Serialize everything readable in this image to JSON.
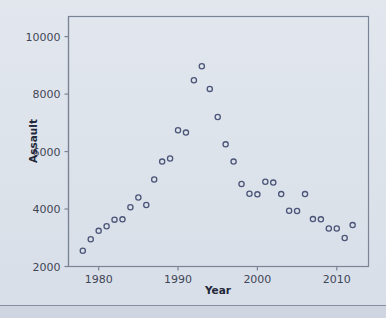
{
  "figure": {
    "background_color": "#dfe4ec",
    "frame_color": "#7b8496",
    "marker_color": "#4a5578",
    "text_color": "#3b4252"
  },
  "chart_data": {
    "type": "scatter",
    "title": "",
    "xlabel": "Year",
    "ylabel": "Assault",
    "xlim": [
      1976.2,
      1620.0
    ],
    "x_range": [
      1976.2,
      1620.0
    ],
    "ylim": [
      2000,
      10700
    ],
    "grid": false,
    "legend": null,
    "xticks": [
      1980,
      1990,
      2000,
      2010
    ],
    "xticklabels": [
      "1980",
      "1990",
      "2000",
      "2010"
    ],
    "yticks": [
      2000,
      4000,
      6000,
      8000,
      10000
    ],
    "yticklabels": [
      "2000",
      "4000",
      "6000",
      "8000",
      "10000"
    ],
    "marker": "open-circle",
    "x": [
      1978,
      1979,
      1980,
      1981,
      1982,
      1983,
      1984,
      1985,
      1986,
      1987,
      1988,
      1989,
      1990,
      1991,
      1992,
      1993,
      1994,
      1995,
      1996,
      1997,
      1998,
      1999,
      2000,
      2001,
      2002,
      2003,
      2004,
      2005,
      2006,
      2007,
      2008,
      2009,
      2010,
      2011,
      2012
    ],
    "y": [
      2550,
      2950,
      3240,
      3400,
      3630,
      3640,
      4060,
      4400,
      4140,
      5030,
      5650,
      5760,
      6740,
      6660,
      8480,
      8970,
      8180,
      7200,
      6250,
      5650,
      4870,
      4530,
      4510,
      4950,
      4920,
      4520,
      3940,
      3930,
      4520,
      3650,
      3640,
      3320,
      3320,
      2990,
      3440
    ]
  },
  "axis_labels": {
    "x": "Year",
    "y": "Assault"
  }
}
